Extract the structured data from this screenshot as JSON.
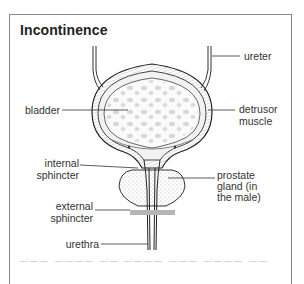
{
  "figure": {
    "title": "Incontinence",
    "labels": {
      "ureter": "ureter",
      "bladder": "bladder",
      "detrusor_muscle_line1": "detrusor",
      "detrusor_muscle_line2": "muscle",
      "internal_sphincter_line1": "internal",
      "internal_sphincter_line2": "sphincter",
      "prostate_line1": "prostate",
      "prostate_line2": "gland (in",
      "prostate_line3": "the male)",
      "external_sphincter_line1": "external",
      "external_sphincter_line2": "sphincter",
      "urethra": "urethra"
    },
    "caption_partial": "The ... (cut off)",
    "colors": {
      "frame": "#8a8a8a",
      "ink": "#333333",
      "external_sphincter_band": "#b5b5b5"
    }
  }
}
